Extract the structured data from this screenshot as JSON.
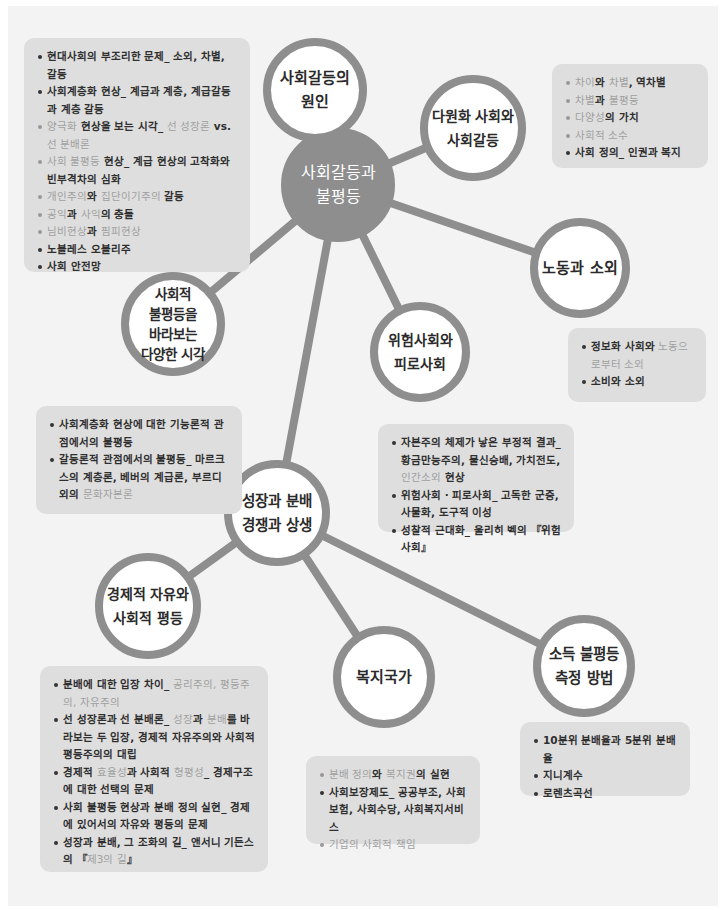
{
  "diagram": {
    "title": "사회갈등과 불평등",
    "colors": {
      "panel": "#f3f3f3",
      "node_ring": "#8e8e8e",
      "box": "#dedede",
      "text": "#2f2f2f",
      "highlight_text": "#a0a0a0"
    },
    "center_node": {
      "label": "사회갈등과\n불평등"
    },
    "nodes": [
      {
        "id": "causes",
        "label": "사회갈등의\n원인"
      },
      {
        "id": "pluralism",
        "label": "다원화 사회와\n사회갈등"
      },
      {
        "id": "labor",
        "label": "노동과 소외"
      },
      {
        "id": "risk",
        "label": "위험사회와\n피로사회"
      },
      {
        "id": "perspectives",
        "label": "사회적\n불평등을\n바라보는\n다양한 시각"
      },
      {
        "id": "growth",
        "label": "성장과 분배\n경쟁과 상생"
      },
      {
        "id": "freedom",
        "label": "경제적 자유와\n사회적 평등"
      },
      {
        "id": "welfare",
        "label": "복지국가"
      },
      {
        "id": "income",
        "label": "소득 불평등\n측정 방법"
      }
    ],
    "boxes": {
      "causes": [
        [
          {
            "t": "현대사회의 부조리한 문제_ 소외, 차별, 갈등",
            "s": "b"
          }
        ],
        [
          {
            "t": "사회계층화 현상_ 계급과 계층, 계급갈등과 계층 갈등",
            "s": "b"
          }
        ],
        [
          {
            "t": "양극화",
            "s": "hl"
          },
          {
            "t": " 현상을 보는 시각_ ",
            "s": "b"
          },
          {
            "t": "선 성장론",
            "s": "hl"
          },
          {
            "t": " vs. ",
            "s": "b"
          },
          {
            "t": "선 분배론",
            "s": "hl"
          }
        ],
        [
          {
            "t": "사회 불평등",
            "s": "hl"
          },
          {
            "t": " 현상_ 계급 현상의 고착화와 빈부격차의 심화",
            "s": "b"
          }
        ],
        [
          {
            "t": "개인주의",
            "s": "hl"
          },
          {
            "t": "와 ",
            "s": "b"
          },
          {
            "t": "집단이기주의",
            "s": "hl"
          },
          {
            "t": " 갈등",
            "s": "b"
          }
        ],
        [
          {
            "t": "공익",
            "s": "hl"
          },
          {
            "t": "과 ",
            "s": "b"
          },
          {
            "t": "사익",
            "s": "hl"
          },
          {
            "t": "의 충돌",
            "s": "b"
          }
        ],
        [
          {
            "t": "님비현상",
            "s": "hl"
          },
          {
            "t": "과 ",
            "s": "b"
          },
          {
            "t": "핌피현상",
            "s": "hl"
          }
        ],
        [
          {
            "t": "노블레스 오블리주",
            "s": "b"
          }
        ],
        [
          {
            "t": "사회 안전망",
            "s": "b"
          }
        ]
      ],
      "pluralism": [
        [
          {
            "t": "차이",
            "s": "hl"
          },
          {
            "t": "와 ",
            "s": "b"
          },
          {
            "t": "차별",
            "s": "hl"
          },
          {
            "t": ", 역차별",
            "s": "b"
          }
        ],
        [
          {
            "t": "차별",
            "s": "hl"
          },
          {
            "t": "과 ",
            "s": "b"
          },
          {
            "t": "불평등",
            "s": "hl"
          }
        ],
        [
          {
            "t": "다양성",
            "s": "hl"
          },
          {
            "t": "의 가치",
            "s": "b"
          }
        ],
        [
          {
            "t": "사회적 소수",
            "s": "hl"
          }
        ],
        [
          {
            "t": "사회 정의_ 인권과 복지",
            "s": "b"
          }
        ]
      ],
      "labor": [
        [
          {
            "t": "정보화 사회와 ",
            "s": "b"
          },
          {
            "t": "노동으로부터 소외",
            "s": "hl"
          }
        ],
        [
          {
            "t": "소비와 소외",
            "s": "b"
          }
        ]
      ],
      "perspectives": [
        [
          {
            "t": "사회계층화 현상에 대한 기능론적 관점에서의 불평등",
            "s": "b"
          }
        ],
        [
          {
            "t": "갈등론적 관점에서의 불평등_ 마르크스의 계층론, 베버의 계급론, 부르디외의 ",
            "s": "b"
          },
          {
            "t": "문화자본론",
            "s": "hl"
          }
        ]
      ],
      "risk": [
        [
          {
            "t": "자본주의 체제가 낳은 부정적 결과_ 황금만능주의, 물신숭배, 가치전도, ",
            "s": "b"
          },
          {
            "t": "인간소외",
            "s": "hl"
          },
          {
            "t": " 현상",
            "s": "b"
          }
        ],
        [
          {
            "t": "위험사회 · 피로사회_ 고독한 군중, 사물화, 도구적 이성",
            "s": "b"
          }
        ],
        [
          {
            "t": "성찰적 근대화_ 울리히 벡의 『위험사회』",
            "s": "b"
          }
        ]
      ],
      "freedom": [
        [
          {
            "t": "분배에 대한 입장 차이_ ",
            "s": "b"
          },
          {
            "t": "공리주의, 평등주의, 자유주의",
            "s": "hl"
          }
        ],
        [
          {
            "t": "선 성장론과 선 분배론_ ",
            "s": "b"
          },
          {
            "t": "성장",
            "s": "hl"
          },
          {
            "t": "과 ",
            "s": "b"
          },
          {
            "t": "분배",
            "s": "hl"
          },
          {
            "t": "를 바라보는 두 입장, 경제적 자유주의와 사회적 평등주의의 대립",
            "s": "b"
          }
        ],
        [
          {
            "t": "경제적 ",
            "s": "b"
          },
          {
            "t": "효율성",
            "s": "hl"
          },
          {
            "t": "과 사회적 ",
            "s": "b"
          },
          {
            "t": "형평성",
            "s": "hl"
          },
          {
            "t": "_ 경제구조에 대한 선택의 문제",
            "s": "b"
          }
        ],
        [
          {
            "t": "사회 불평등 현상과 분배 정의 실현_ 경제에 있어서의 자유와 평등의 문제",
            "s": "b"
          }
        ],
        [
          {
            "t": "성장과 분배, 그 조화의 길_ 앤서니 기든스의 『",
            "s": "b"
          },
          {
            "t": "제3의 길",
            "s": "hl"
          },
          {
            "t": "』",
            "s": "b"
          }
        ]
      ],
      "welfare": [
        [
          {
            "t": "분배 정의",
            "s": "hl"
          },
          {
            "t": "와 ",
            "s": "b"
          },
          {
            "t": "복지권",
            "s": "hl"
          },
          {
            "t": "의 실현",
            "s": "b"
          }
        ],
        [
          {
            "t": "사회보장제도_ 공공부조, 사회보험, 사회수당, 사회복지서비스",
            "s": "b"
          }
        ],
        [
          {
            "t": "기업의 사회적 책임",
            "s": "hl"
          }
        ]
      ],
      "income": [
        [
          {
            "t": "10분위 분배율과 5분위 분배율",
            "s": "b"
          }
        ],
        [
          {
            "t": "지니계수",
            "s": "b"
          }
        ],
        [
          {
            "t": "로렌츠곡선",
            "s": "b"
          }
        ]
      ]
    }
  }
}
